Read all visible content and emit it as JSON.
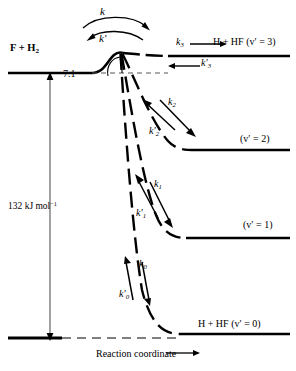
{
  "figure": {
    "type": "energy-level-reaction-diagram",
    "reaction": "F + H2 -> H + HF(v')",
    "axis": {
      "x_label": "Reaction coordinate",
      "x_arrow": "right",
      "y_quantity": "energy"
    },
    "reactant_level": {
      "label": "F + H",
      "label_sub": "2",
      "energy_rel": 0
    },
    "barrier": {
      "height_label": "7.1",
      "units_implied": "kJ mol-1",
      "forward_rate": "k",
      "reverse_rate": "k′"
    },
    "overall_energy": {
      "value": "132",
      "unit_main": " kJ mol",
      "unit_exp": "−1",
      "full": "132 kJ mol−1"
    },
    "product_channels": [
      {
        "v": "3",
        "label": "H + HF (v′ = 3)",
        "forward_rate": "k",
        "forward_sub": "3",
        "reverse_rate": "k′",
        "reverse_sub": "3",
        "level_y": 56
      },
      {
        "v": "2",
        "label": "(v′ = 2)",
        "forward_rate": "k",
        "forward_sub": "2",
        "reverse_rate": "k′",
        "reverse_sub": "2",
        "level_y": 150
      },
      {
        "v": "1",
        "label": "(v′ = 1)",
        "forward_rate": "k",
        "forward_sub": "1",
        "reverse_rate": "k′",
        "reverse_sub": "1",
        "level_y": 238
      },
      {
        "v": "0",
        "label": "H + HF (v′ = 0)",
        "forward_rate": "k",
        "forward_sub": "0",
        "reverse_rate": "k′",
        "reverse_sub": "0",
        "level_y": 334
      }
    ],
    "colors": {
      "ink": "#000000",
      "background": "#ffffff",
      "dashed": "#1a1a1a"
    }
  }
}
